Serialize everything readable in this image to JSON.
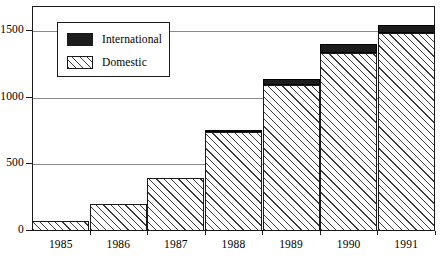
{
  "chart_data": {
    "type": "bar",
    "subtype": "stacked-vertical",
    "title": "",
    "xlabel": "",
    "ylabel": "",
    "categories": [
      "1985",
      "1986",
      "1987",
      "1988",
      "1989",
      "1990",
      "1991"
    ],
    "series": [
      {
        "name": "Domestic",
        "fill": "diagonal-hatch",
        "color": "#ffffff",
        "values": [
          75,
          200,
          400,
          740,
          1095,
          1335,
          1485
        ]
      },
      {
        "name": "International",
        "fill": "solid-black",
        "color": "#1c1c1c",
        "values": [
          0,
          0,
          0,
          15,
          45,
          70,
          60
        ]
      }
    ],
    "totals": [
      75,
      200,
      400,
      755,
      1140,
      1405,
      1545
    ],
    "ylim": [
      0,
      1700
    ],
    "yticks": [
      0,
      500,
      1000,
      1500
    ],
    "ytick_labels": [
      "0",
      "500",
      "1000",
      "1500"
    ],
    "grid": "horizontal",
    "legend_position": "top-left-inside",
    "frame": "box"
  },
  "legend": {
    "items": [
      {
        "label": "International",
        "swatch": "solid-black-swatch"
      },
      {
        "label": "Domestic",
        "swatch": "diagonal-hatch-swatch"
      }
    ]
  },
  "axes": {
    "y": {
      "ticks": [
        {
          "label": "1500",
          "value": 1500
        },
        {
          "label": "1000",
          "value": 1000
        },
        {
          "label": "500",
          "value": 500
        },
        {
          "label": "0",
          "value": 0
        }
      ]
    },
    "x": {
      "ticks": [
        {
          "label": "1985"
        },
        {
          "label": "1986"
        },
        {
          "label": "1987"
        },
        {
          "label": "1988"
        },
        {
          "label": "1989"
        },
        {
          "label": "1990"
        },
        {
          "label": "1991"
        }
      ]
    }
  },
  "colors": {
    "axis": "#1a1a1a",
    "grid": "#8a8a8a",
    "international": "#1c1c1c",
    "domestic": "#ffffff",
    "background": "#ffffff"
  }
}
